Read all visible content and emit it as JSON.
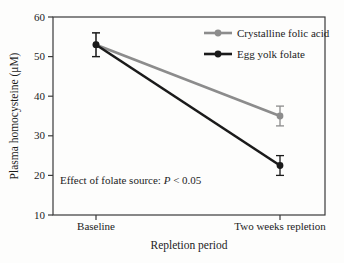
{
  "chart_data": {
    "type": "line",
    "title": "",
    "xlabel": "Repletion period",
    "ylabel": "Plasma homocysteine (μM)",
    "categories": [
      "Baseline",
      "Two weeks repletion"
    ],
    "series": [
      {
        "name": "Crystalline folic acid",
        "color": "#8c8c8c",
        "values": [
          53,
          35
        ],
        "errors": [
          3,
          2.5
        ]
      },
      {
        "name": "Egg yolk folate",
        "color": "#1a1a1a",
        "values": [
          53,
          22.5
        ],
        "errors": [
          3,
          2.5
        ]
      }
    ],
    "ylim": [
      10,
      60
    ],
    "yticks": [
      60,
      50,
      40,
      30,
      20,
      10
    ],
    "grid": false,
    "legend_position": "top-right",
    "annotation": {
      "prefix": "Effect of folate source: ",
      "stat": "P",
      "comparison": " < 0.05"
    }
  },
  "colors": {
    "background": "#fdfdfc",
    "frame": "#3a3a3a",
    "text": "#1c1c1c",
    "series_gray": "#8c8c8c",
    "series_black": "#1a1a1a"
  }
}
